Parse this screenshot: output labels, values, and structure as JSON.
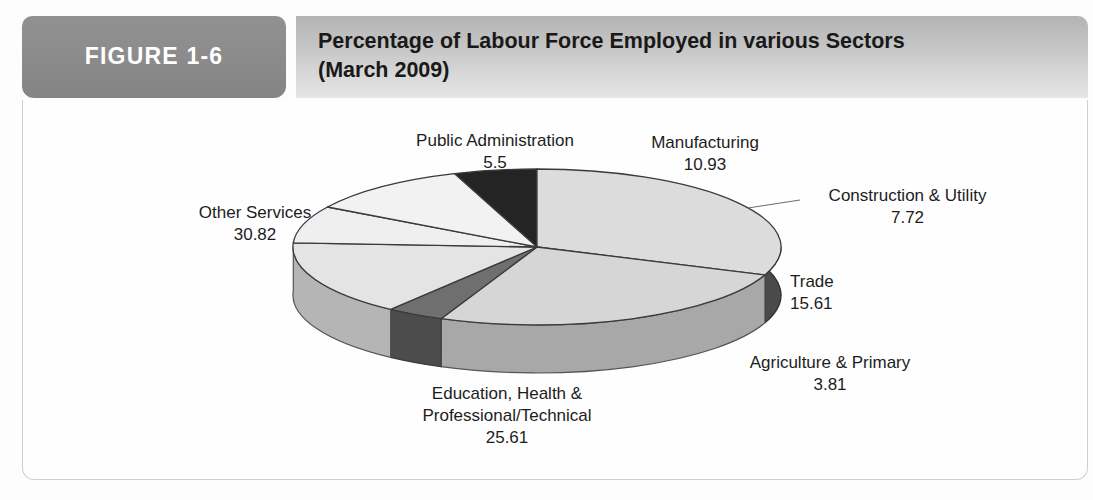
{
  "figure": {
    "tab_label": "FIGURE 1-6",
    "title_line1": "Percentage of Labour Force Employed in various Sectors",
    "title_line2": "(March 2009)"
  },
  "colors": {
    "tab_gray": "#8b8b8b",
    "title_gray": "#c8c8c8",
    "panel_white": "#fefefe",
    "slice_light": "#d4d4d4",
    "slice_white": "#f2f2f2",
    "slice_dark": "#3b3b3b",
    "slice_black": "#242424",
    "slice_mid": "#6e6e6e"
  },
  "chart_data": {
    "type": "pie",
    "title": "Percentage of Labour Force Employed in various Sectors (March 2009)",
    "subtitle": "(March 2009)",
    "xlabel": "",
    "ylabel": "",
    "grid": false,
    "legend_position": "none",
    "style": "3d-pie",
    "units": "percent",
    "categories": [
      "Public Administration",
      "Manufacturing",
      "Construction & Utility",
      "Trade",
      "Agriculture & Primary",
      "Education, Health & Professional/Technical",
      "Other Services"
    ],
    "values": [
      5.5,
      10.93,
      7.72,
      15.61,
      3.81,
      25.61,
      30.82
    ],
    "slices": [
      {
        "label": "Public Administration",
        "label_line2": "",
        "value": 5.5,
        "value_text": "5.5",
        "fill": "#242424",
        "side": "#151515"
      },
      {
        "label": "Manufacturing",
        "label_line2": "",
        "value": 10.93,
        "value_text": "10.93",
        "fill": "#f2f2f2",
        "side": "#c9c9c9"
      },
      {
        "label": "Construction & Utility",
        "label_line2": "",
        "value": 7.72,
        "value_text": "7.72",
        "fill": "#efefef",
        "side": "#c4c4c4"
      },
      {
        "label": "Trade",
        "label_line2": "",
        "value": 15.61,
        "value_text": "15.61",
        "fill": "#e4e4e4",
        "side": "#b5b5b5"
      },
      {
        "label": "Agriculture & Primary",
        "label_line2": "",
        "value": 3.81,
        "value_text": "3.81",
        "fill": "#6f6f6f",
        "side": "#4c4c4c"
      },
      {
        "label": "Education, Health &",
        "label_line2": "Professional/Technical",
        "value": 25.61,
        "value_text": "25.61",
        "fill": "#d6d6d6",
        "side": "#a8a8a8"
      },
      {
        "label": "Other Services",
        "label_line2": "",
        "value": 30.82,
        "value_text": "30.82",
        "fill": "#dcdcdc",
        "side": "#4a4a4a"
      }
    ]
  },
  "labels": {
    "public_administration": {
      "name": "Public Administration",
      "value": "5.5"
    },
    "manufacturing": {
      "name": "Manufacturing",
      "value": "10.93"
    },
    "construction_utility": {
      "name": "Construction & Utility",
      "value": "7.72"
    },
    "trade": {
      "name": "Trade",
      "value": "15.61"
    },
    "agriculture_primary": {
      "name": "Agriculture & Primary",
      "value": "3.81"
    },
    "education_health": {
      "name_line1": "Education, Health &",
      "name_line2": "Professional/Technical",
      "value": "25.61"
    },
    "other_services": {
      "name": "Other Services",
      "value": "30.82"
    }
  }
}
